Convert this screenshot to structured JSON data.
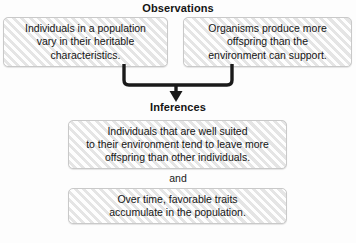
{
  "diagram": {
    "background_color": "#fdfdfd",
    "box_fill_color": "#f2f2f2",
    "box_border_color": "#c9c9c9",
    "connector_color": "#1a1a1a",
    "text_color": "#151515"
  },
  "sections": {
    "observations": {
      "heading": "Observations",
      "boxes": [
        {
          "id": "observation-1",
          "text": "Individuals in a population\nvary in their heritable\ncharacteristics."
        },
        {
          "id": "observation-2",
          "text": "Organisms produce more\noffspring than the\nenvironment can support."
        }
      ]
    },
    "inferences": {
      "heading": "Inferences",
      "conjunction": "and",
      "boxes": [
        {
          "id": "inference-1",
          "text": "Individuals that are well suited\nto their environment tend to leave more\noffspring than other individuals."
        },
        {
          "id": "inference-2",
          "text": "Over time, favorable traits\naccumulate in the population."
        }
      ]
    }
  },
  "connector": {
    "name": "merge-arrow-down-icon",
    "direction": "down",
    "from": [
      "observation-1",
      "observation-2"
    ],
    "to": "inference-1"
  }
}
